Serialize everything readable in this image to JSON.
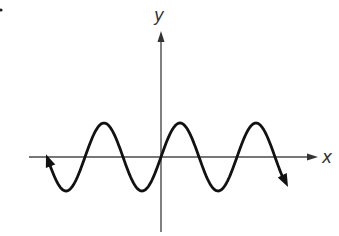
{
  "chart_data": {
    "type": "line",
    "title": "",
    "function_form": "y = A sin(Bx)",
    "xlabel": "x",
    "ylabel": "y",
    "grid": false,
    "ticks": "none",
    "x_axis_arrow": "right",
    "y_axis_arrow": "up",
    "curve_end_arrows": [
      "left",
      "right"
    ],
    "shape": {
      "amplitude_px": 34,
      "period_px": 76,
      "phase": "sine, through origin increasing",
      "domain_px_from_origin": [
        -115,
        127
      ],
      "visible_peaks": 3,
      "visible_troughs": 3
    },
    "key_points_relative": [
      {
        "name": "trough",
        "x": -1.25,
        "y": -1
      },
      {
        "name": "zero",
        "x": -1.0,
        "y": 0
      },
      {
        "name": "peak",
        "x": -0.75,
        "y": 1
      },
      {
        "name": "zero",
        "x": -0.5,
        "y": 0
      },
      {
        "name": "trough",
        "x": -0.25,
        "y": -1
      },
      {
        "name": "origin",
        "x": 0,
        "y": 0
      },
      {
        "name": "peak",
        "x": 0.25,
        "y": 1
      },
      {
        "name": "zero",
        "x": 0.5,
        "y": 0
      },
      {
        "name": "trough",
        "x": 0.75,
        "y": -1
      },
      {
        "name": "zero",
        "x": 1.0,
        "y": 0
      },
      {
        "name": "peak",
        "x": 1.25,
        "y": 1
      },
      {
        "name": "zero",
        "x": 1.5,
        "y": 0
      }
    ]
  },
  "labels": {
    "x_axis": "x",
    "y_axis": "y"
  },
  "colors": {
    "curve": "#111111",
    "axes": "#4a4a4a",
    "background": "#ffffff"
  },
  "geometry": {
    "origin": [
      161,
      157
    ],
    "x_axis": [
      29,
      318
    ],
    "y_axis": [
      30,
      232
    ]
  }
}
